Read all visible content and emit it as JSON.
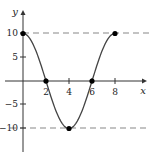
{
  "chart_data": {
    "type": "line",
    "title": "",
    "xlabel": "x",
    "ylabel": "y",
    "xlim": [
      -2,
      10.5
    ],
    "ylim": [
      -15,
      15
    ],
    "grid": false,
    "function": "y = 10cos(pi*x/4)",
    "x": [
      0,
      2,
      4,
      6,
      8
    ],
    "series": [
      {
        "name": "curve",
        "values": [
          10,
          0,
          -10,
          0,
          10
        ]
      }
    ],
    "marked_points": [
      {
        "x": 0,
        "y": 10
      },
      {
        "x": 2,
        "y": 0
      },
      {
        "x": 4,
        "y": -10
      },
      {
        "x": 6,
        "y": 0
      },
      {
        "x": 8,
        "y": 10
      }
    ],
    "reference_lines": [
      {
        "orientation": "horizontal",
        "y": 10,
        "style": "dashed"
      },
      {
        "orientation": "horizontal",
        "y": -10,
        "style": "dashed"
      }
    ],
    "x_ticks": [
      2,
      4,
      6,
      8
    ],
    "x_tick_labels": [
      "2",
      "4",
      "6",
      "8"
    ],
    "y_ticks": [
      10,
      5,
      -5,
      -10
    ],
    "y_tick_labels": [
      "10",
      "5",
      "−5",
      "−10"
    ],
    "colors": {
      "axis": "#333333",
      "curve": "#444444",
      "dashed": "#777777",
      "points": "#000000"
    }
  }
}
